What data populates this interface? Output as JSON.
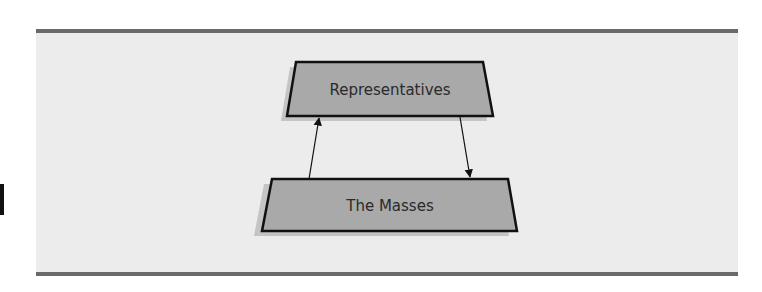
{
  "figure": {
    "background_color": "#ececec",
    "border_color": "#6a6a6a",
    "node_fill": "#a9a9a9",
    "shadow_color": "#c4c4c4",
    "stroke_color": "#111111"
  },
  "nodes": [
    {
      "id": "representatives",
      "label": "Representatives",
      "shape": "trapezoid",
      "level": "top"
    },
    {
      "id": "masses",
      "label": "The Masses",
      "shape": "trapezoid",
      "level": "bottom"
    }
  ],
  "edges": [
    {
      "from": "masses",
      "to": "representatives",
      "direction": "up"
    },
    {
      "from": "representatives",
      "to": "masses",
      "direction": "down"
    }
  ]
}
